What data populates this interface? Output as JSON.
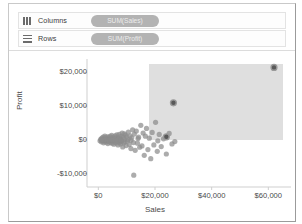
{
  "window": {
    "title": "Tableau worksheet"
  },
  "shelves": [
    {
      "name": "columns",
      "label": "Columns",
      "icon": "columns-bars-icon",
      "pill": "SUM(Sales)"
    },
    {
      "name": "rows",
      "label": "Rows",
      "icon": "rows-bars-icon",
      "pill": "SUM(Profit)"
    }
  ],
  "colors": {
    "mark": "#8c8c8c",
    "mark_selected": "#595959",
    "selection_fill": "#d9d9d9",
    "axis": "#cfcfcf",
    "pill": "#b3b3b3",
    "text": "#4a4a4a"
  },
  "selection": {
    "label": "selection-rectangle",
    "x0": 62,
    "y0": 9,
    "x1": 196,
    "y1": 85,
    "selected_count": 3
  },
  "chart_data": {
    "type": "scatter",
    "title": "",
    "xlabel": "Sales",
    "ylabel": "Profit",
    "xlim": [
      -4000,
      68000
    ],
    "ylim": [
      -14000,
      24000
    ],
    "xticks": [
      0,
      20000,
      40000,
      60000
    ],
    "xticklabels": [
      "$0",
      "$20,000",
      "$40,000",
      "$60,000"
    ],
    "yticks": [
      20000,
      10000,
      0,
      -10000
    ],
    "yticklabels": [
      "$20,000",
      "$10,000",
      "$0",
      "-$10,000"
    ],
    "grid": false,
    "legend": false,
    "series": [
      {
        "name": "Customers",
        "points": [
          [
            600,
            -300
          ],
          [
            900,
            200
          ],
          [
            1100,
            -600
          ],
          [
            1300,
            500
          ],
          [
            1500,
            -200
          ],
          [
            1700,
            800
          ],
          [
            1850,
            -900
          ],
          [
            2000,
            300
          ],
          [
            2150,
            -400
          ],
          [
            2300,
            1100
          ],
          [
            2450,
            -100
          ],
          [
            2600,
            600
          ],
          [
            2750,
            -700
          ],
          [
            2900,
            250
          ],
          [
            3050,
            -350
          ],
          [
            3200,
            900
          ],
          [
            3350,
            -1100
          ],
          [
            3500,
            150
          ],
          [
            3650,
            -250
          ],
          [
            3800,
            700
          ],
          [
            3950,
            -500
          ],
          [
            4100,
            1000
          ],
          [
            4250,
            -800
          ],
          [
            4400,
            400
          ],
          [
            4550,
            -150
          ],
          [
            4700,
            1300
          ],
          [
            4850,
            -1000
          ],
          [
            5000,
            550
          ],
          [
            5150,
            -450
          ],
          [
            5300,
            850
          ],
          [
            5450,
            -1300
          ],
          [
            5600,
            350
          ],
          [
            5750,
            -200
          ],
          [
            5900,
            1200
          ],
          [
            6050,
            -650
          ],
          [
            6200,
            450
          ],
          [
            6350,
            -950
          ],
          [
            6500,
            1500
          ],
          [
            6650,
            -300
          ],
          [
            6800,
            750
          ],
          [
            6950,
            -1500
          ],
          [
            7100,
            250
          ],
          [
            7250,
            -550
          ],
          [
            7400,
            1600
          ],
          [
            7550,
            -750
          ],
          [
            7700,
            500
          ],
          [
            7850,
            -1200
          ],
          [
            8000,
            1000
          ],
          [
            8200,
            -400
          ],
          [
            8400,
            2000
          ],
          [
            8600,
            -2100
          ],
          [
            8800,
            650
          ],
          [
            9000,
            -900
          ],
          [
            9200,
            1800
          ],
          [
            9400,
            -600
          ],
          [
            9600,
            1400
          ],
          [
            9800,
            -1700
          ],
          [
            10000,
            900
          ],
          [
            10300,
            -350
          ],
          [
            10600,
            2300
          ],
          [
            10900,
            -1400
          ],
          [
            11200,
            1200
          ],
          [
            11500,
            -2600
          ],
          [
            11800,
            600
          ],
          [
            12100,
            3000
          ],
          [
            12400,
            -800
          ],
          [
            12700,
            1700
          ],
          [
            13000,
            -3100
          ],
          [
            13400,
            2600
          ],
          [
            13800,
            -1000
          ],
          [
            14200,
            800
          ],
          [
            14600,
            -2200
          ],
          [
            15000,
            4300
          ],
          [
            15400,
            -1800
          ],
          [
            15800,
            2000
          ],
          [
            16200,
            -4600
          ],
          [
            16600,
            1100
          ],
          [
            17000,
            3400
          ],
          [
            17500,
            -2900
          ],
          [
            18000,
            500
          ],
          [
            18500,
            -5600
          ],
          [
            19000,
            2200
          ],
          [
            19600,
            -1500
          ],
          [
            20200,
            5200
          ],
          [
            20800,
            -3400
          ],
          [
            21500,
            1600
          ],
          [
            22200,
            -2000
          ],
          [
            23000,
            300
          ],
          [
            24000,
            -4200
          ],
          [
            25000,
            1900
          ],
          [
            26000,
            -1200
          ],
          [
            3000,
            0
          ],
          [
            3700,
            -50
          ],
          [
            4300,
            120
          ],
          [
            5100,
            -80
          ],
          [
            5800,
            60
          ],
          [
            6600,
            -120
          ],
          [
            7300,
            90
          ],
          [
            8100,
            -60
          ],
          [
            9100,
            180
          ],
          [
            2100,
            -60
          ],
          [
            2500,
            80
          ],
          [
            1900,
            40
          ],
          [
            1400,
            -40
          ],
          [
            1000,
            90
          ],
          [
            12500,
            -10500
          ],
          [
            21000,
            -300
          ],
          [
            27000,
            -500
          ],
          [
            14000,
            400
          ],
          [
            10500,
            100
          ],
          [
            11500,
            -150
          ]
        ]
      }
    ],
    "selected_points": [
      [
        62000,
        21500
      ],
      [
        26500,
        11000
      ],
      [
        24000,
        900
      ]
    ]
  }
}
